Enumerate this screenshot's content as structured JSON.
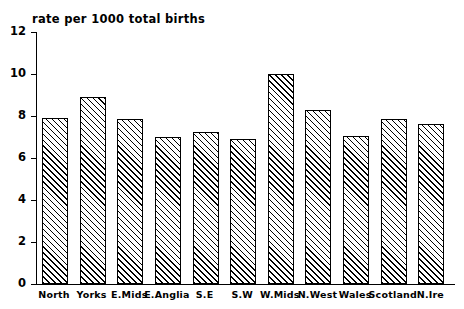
{
  "chart_data": {
    "type": "bar",
    "title": "rate per 1000 total births",
    "xlabel": "",
    "ylabel": "",
    "ylim": [
      0,
      12
    ],
    "yticks": [
      0,
      2,
      4,
      6,
      8,
      10,
      12
    ],
    "grid": false,
    "legend": null,
    "categories": [
      "North",
      "Yorks",
      "E.Mids",
      "E.Anglia",
      "S.E",
      "S.W",
      "W.Mids",
      "N.West",
      "Wales",
      "Scotland",
      "N.Ire"
    ],
    "values": [
      7.9,
      8.9,
      7.85,
      7.0,
      7.25,
      6.9,
      10.0,
      8.3,
      7.05,
      7.85,
      7.6
    ],
    "series": [
      {
        "name": "rate per 1000 total births",
        "values": [
          7.9,
          8.9,
          7.85,
          7.0,
          7.25,
          6.9,
          10.0,
          8.3,
          7.05,
          7.85,
          7.6
        ]
      }
    ],
    "bar_style": {
      "fill": "#ffffff",
      "edge_color": "#000000",
      "hatch": "diagonal-45"
    }
  },
  "axes": {
    "y_tick_labels": [
      "0",
      "2",
      "4",
      "6",
      "8",
      "10",
      "12"
    ]
  }
}
